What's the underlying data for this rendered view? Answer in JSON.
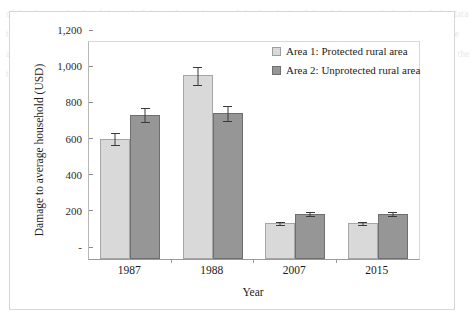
{
  "chart_data": {
    "type": "bar",
    "title": "",
    "xlabel": "Year",
    "ylabel": "Damage to average household (USD)",
    "categories": [
      "1987",
      "1988",
      "2007",
      "2015"
    ],
    "ylim": [
      0,
      1200
    ],
    "yticks": [
      0,
      200,
      400,
      600,
      800,
      1000,
      1200
    ],
    "ytick_labels": [
      "-",
      "200",
      "400",
      "600",
      "800",
      "1,000",
      "1,200"
    ],
    "grid": false,
    "legend_position": "top-right",
    "series": [
      {
        "name": "Area 1: Protected rural area",
        "color": "#D9D9D9",
        "values": [
          665,
          1015,
          200,
          200
        ],
        "errors": [
          35,
          55,
          12,
          12
        ]
      },
      {
        "name": "Area 2: Unprotected rural area",
        "color": "#969696",
        "values": [
          798,
          806,
          250,
          250
        ],
        "errors": [
          40,
          45,
          13,
          13
        ]
      }
    ]
  },
  "bleed_text": "of the data set the the of the and of the to the study area of the the  the in of the of the area and  the  the  of  the data  that  area  the study and the of the and the data and that in the  the of the area  the of the in the data of the and the appendix of the of the data the study of the area and the of the Appendix the the and the of the data and the area  the  the of  the in the of the and the road the in the and of the data"
}
